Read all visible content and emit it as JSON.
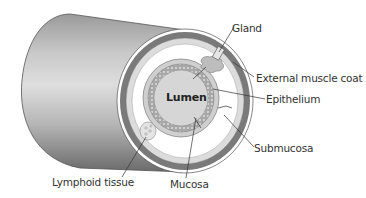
{
  "diagram": {
    "labels": {
      "gland": "Gland",
      "external_muscle_coat": "External muscle coat",
      "epithelium": "Epithelium",
      "submucosa": "Submucosa",
      "mucosa": "Mucosa",
      "lymphoid_tissue": "Lymphoid tissue",
      "lumen": "Lumen"
    },
    "colors": {
      "tube_dark": "#6e6e6e",
      "tube_light": "#d8d8d8",
      "muscle_band": "#7a7a7a",
      "light_band": "#dcdcdc",
      "submucosa": "#ffffff",
      "mucosa": "#cfcfcf",
      "lumen": "#d6d6d6",
      "line": "#333333"
    }
  }
}
